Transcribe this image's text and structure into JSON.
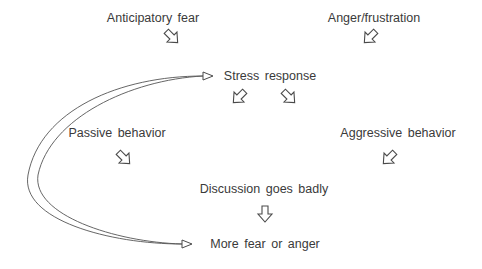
{
  "diagram": {
    "nodes": {
      "anticipatory_fear": {
        "label": "Anticipatory fear"
      },
      "anger_frustration": {
        "label": "Anger/frustration"
      },
      "stress_response": {
        "label": "Stress response"
      },
      "passive_behavior": {
        "label": "Passive behavior"
      },
      "aggressive_behavior": {
        "label": "Aggressive behavior"
      },
      "discussion_goes_badly": {
        "label": "Discussion goes badly"
      },
      "more_fear_or_anger": {
        "label": "More fear or anger"
      }
    },
    "edges": [
      {
        "from": "Anticipatory fear",
        "to": "Stress response",
        "style": "block-arrow-down-right"
      },
      {
        "from": "Anger/frustration",
        "to": "Stress response",
        "style": "block-arrow-down-left"
      },
      {
        "from": "Stress response",
        "to": "Passive behavior",
        "style": "block-arrow-down-left"
      },
      {
        "from": "Stress response",
        "to": "Aggressive behavior",
        "style": "block-arrow-down-right"
      },
      {
        "from": "Passive behavior",
        "to": "Discussion goes badly",
        "style": "block-arrow-down-right"
      },
      {
        "from": "Aggressive behavior",
        "to": "Discussion goes badly",
        "style": "block-arrow-down-left"
      },
      {
        "from": "Discussion goes badly",
        "to": "More fear or anger",
        "style": "block-arrow-down"
      },
      {
        "from": "More fear or anger",
        "to": "Stress response",
        "style": "curved-feedback-loop"
      }
    ],
    "colors": {
      "text": "#3a3a3a",
      "stroke": "#4a4a4a",
      "background": "#ffffff"
    }
  }
}
